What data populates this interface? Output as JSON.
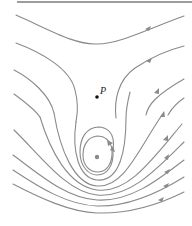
{
  "diagram": {
    "type": "streamline-flow",
    "colors": {
      "stream": "#8a8a8a",
      "rule": "#3a3a3a",
      "point": "#111111",
      "center": "#8a8a8a"
    },
    "top_rule": {
      "x1": 17,
      "x2": 192,
      "y": 2
    },
    "point_P": {
      "label": "P",
      "x": 97,
      "y": 97
    },
    "center_point": {
      "x": 97,
      "y": 157
    },
    "streamlines_count": 13,
    "closed_loops": 2
  }
}
